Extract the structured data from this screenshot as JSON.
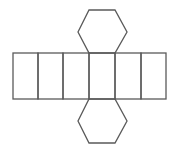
{
  "diagram": {
    "stroke_color": "#5a5a5a",
    "background": "#ffffff",
    "stroke_width": 1.3,
    "rect_strip": {
      "x": 13,
      "y": 53,
      "height": 46,
      "dividers_x": [
        13,
        38,
        63,
        89,
        115,
        141,
        166
      ],
      "face_count": 6
    },
    "top_hexagon": {
      "points": [
        [
          89,
          10
        ],
        [
          115,
          10
        ],
        [
          127,
          32
        ],
        [
          115,
          53
        ],
        [
          89,
          53
        ],
        [
          78,
          32
        ]
      ]
    },
    "bottom_hexagon": {
      "points": [
        [
          89,
          99
        ],
        [
          115,
          99
        ],
        [
          127,
          121
        ],
        [
          115,
          143
        ],
        [
          89,
          143
        ],
        [
          78,
          121
        ]
      ]
    }
  }
}
